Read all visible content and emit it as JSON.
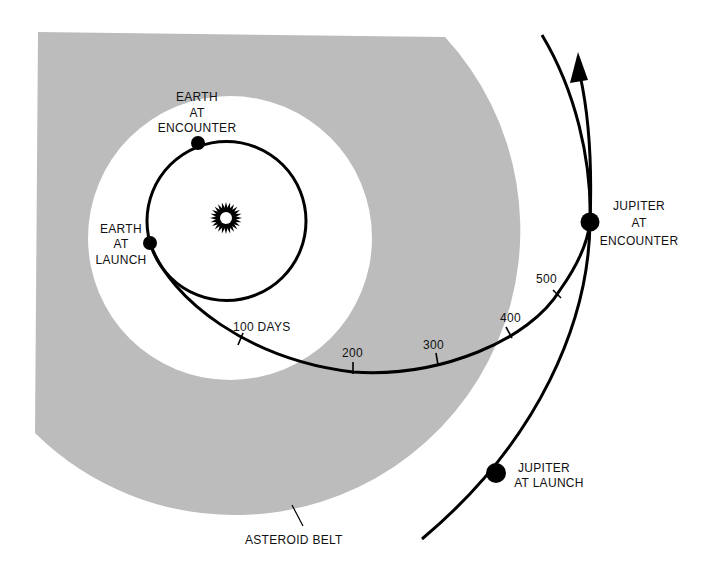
{
  "diagram": {
    "colors": {
      "background": "#ffffff",
      "asteroid_belt": "#bcbcbc",
      "lines": "#000000",
      "text": "#111111"
    },
    "labels": {
      "earth_encounter": [
        "EARTH",
        "AT",
        "ENCOUNTER"
      ],
      "earth_launch": [
        "EARTH",
        "AT",
        "LAUNCH"
      ],
      "jupiter_encounter": [
        "JUPITER",
        "AT",
        "ENCOUNTER"
      ],
      "jupiter_launch": [
        "JUPITER",
        "AT LAUNCH"
      ],
      "asteroid_belt": "ASTEROID BELT"
    },
    "day_ticks": [
      {
        "label": "100 DAYS",
        "day": 100
      },
      {
        "label": "200",
        "day": 200
      },
      {
        "label": "300",
        "day": 300
      },
      {
        "label": "400",
        "day": 400
      },
      {
        "label": "500",
        "day": 500
      }
    ],
    "icons": {
      "sun": "sun-icon",
      "arrow": "direction-arrow-icon"
    }
  }
}
